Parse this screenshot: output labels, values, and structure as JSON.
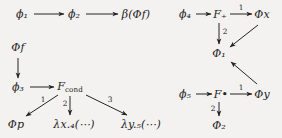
{
  "figure": {
    "background_color": "#f3f2f0",
    "ink_color": "#26241f",
    "width": 282,
    "height": 138
  },
  "diagrams": [
    {
      "name": "left-diagram",
      "nodes": [
        {
          "id": "phi1",
          "text": "ϕ₁",
          "x": 22,
          "y": 14
        },
        {
          "id": "phi2",
          "text": "ϕ₂",
          "x": 74,
          "y": 14
        },
        {
          "id": "beta",
          "text": "β(Φf)",
          "x": 136,
          "y": 14
        },
        {
          "id": "Phif",
          "text": "Φf",
          "x": 18,
          "y": 47
        },
        {
          "id": "phi3",
          "text": "ϕ₃",
          "x": 18,
          "y": 87
        },
        {
          "id": "Fcond",
          "text": "Fcond",
          "x": 70,
          "y": 87
        },
        {
          "id": "Phip",
          "text": "Φp",
          "x": 16,
          "y": 124
        },
        {
          "id": "lamx",
          "text": "λx.₄(⋯)",
          "x": 74,
          "y": 124
        },
        {
          "id": "lamy",
          "text": "λy.₅(⋯)",
          "x": 141,
          "y": 124
        }
      ],
      "edges": [
        {
          "from": "phi1",
          "to": "phi2",
          "label": ""
        },
        {
          "from": "phi2",
          "to": "beta",
          "label": ""
        },
        {
          "from": "Phif",
          "to": "phi3",
          "label": ""
        },
        {
          "from": "phi3",
          "to": "Fcond",
          "label": ""
        },
        {
          "from": "Fcond",
          "to": "Phip",
          "label": "1"
        },
        {
          "from": "Fcond",
          "to": "lamx",
          "label": "2"
        },
        {
          "from": "Fcond",
          "to": "lamy",
          "label": "3"
        }
      ]
    },
    {
      "name": "right-diagram",
      "nodes": [
        {
          "id": "phi4",
          "text": "ϕ₄",
          "x": 185,
          "y": 14
        },
        {
          "id": "Fplus",
          "text": "F₊",
          "x": 220,
          "y": 14
        },
        {
          "id": "Phix",
          "text": "Φx",
          "x": 262,
          "y": 14
        },
        {
          "id": "Phi1",
          "text": "Φ₁",
          "x": 219,
          "y": 53
        },
        {
          "id": "phi5",
          "text": "ϕ₅",
          "x": 185,
          "y": 94
        },
        {
          "id": "Fdot",
          "text": "F•",
          "x": 221,
          "y": 94
        },
        {
          "id": "Phiy",
          "text": "Φy",
          "x": 262,
          "y": 94
        },
        {
          "id": "Phi2",
          "text": "Φ₂",
          "x": 219,
          "y": 125
        }
      ],
      "edges": [
        {
          "from": "phi4",
          "to": "Fplus",
          "label": ""
        },
        {
          "from": "Fplus",
          "to": "Phix",
          "label": "1"
        },
        {
          "from": "Fplus",
          "to": "Phi1",
          "label": "2"
        },
        {
          "from": "Phix",
          "to": "Phi1",
          "label": ""
        },
        {
          "from": "phi5",
          "to": "Fdot",
          "label": ""
        },
        {
          "from": "Fdot",
          "to": "Phiy",
          "label": "1"
        },
        {
          "from": "Fdot",
          "to": "Phi2",
          "label": "2"
        },
        {
          "from": "Phiy",
          "to": "Phi1",
          "label": ""
        }
      ]
    }
  ],
  "labels": {
    "left": {
      "phi1": "ϕ1",
      "phi2": "ϕ2",
      "beta_phif": "β(Φf)",
      "phif": "Φf",
      "phi3": "ϕ3",
      "fcond": "Fcond",
      "phip": "Φp",
      "lambda_x": "λx.4(···)",
      "lambda_y": "λy.5(···)",
      "edge_1": "1",
      "edge_2": "2",
      "edge_3": "3"
    },
    "right": {
      "phi4": "ϕ4",
      "f_plus": "F+",
      "phi_x": "Φx",
      "phi_1": "Φ1",
      "phi5": "ϕ5",
      "f_dot": "F•",
      "phi_y": "Φy",
      "phi_2": "Φ2",
      "edge_top_1": "1",
      "edge_top_2": "2",
      "edge_bot_1": "1",
      "edge_bot_2": "2"
    }
  }
}
